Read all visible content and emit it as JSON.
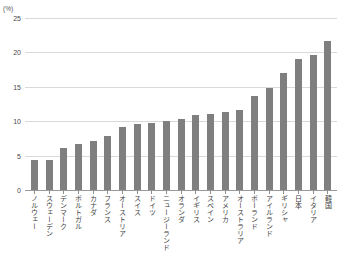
{
  "chart_data": {
    "type": "bar",
    "title": "",
    "subtitle": "",
    "xlabel": "",
    "ylabel": "",
    "unit_label": "(%)",
    "ylim": [
      0,
      25
    ],
    "ytick_values": [
      0,
      5,
      10,
      15,
      20,
      25
    ],
    "ytick_labels": [
      "0",
      "5",
      "10",
      "15",
      "20",
      "25"
    ],
    "grid": true,
    "legend": "none",
    "bar_color": "#7f7f7f",
    "gridline_color": "#d9d9d9",
    "axis_color": "#9a9a9a",
    "categories": [
      "ノルウェー",
      "スウェーデン",
      "デンマーク",
      "ポルトガル",
      "カナダ",
      "フランス",
      "オーストリア",
      "スイス",
      "ドイツ",
      "ニュージーランド",
      "オランダ",
      "イギリス",
      "スペイン",
      "アメリカ",
      "オーストラリア",
      "ポーランド",
      "アイルランド",
      "ギリシャ",
      "日本",
      "イタリア",
      "韓国"
    ],
    "values": [
      4.4,
      4.4,
      6.1,
      6.7,
      7.1,
      7.9,
      9.1,
      9.6,
      9.7,
      10.1,
      10.3,
      10.9,
      11.0,
      11.4,
      11.7,
      13.6,
      14.8,
      17.0,
      19.0,
      19.6,
      21.6
    ]
  }
}
